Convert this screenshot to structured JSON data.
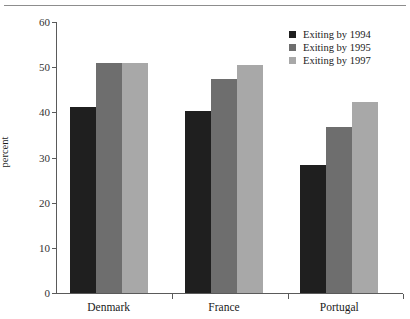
{
  "chart_data": {
    "type": "bar",
    "title": "",
    "xlabel": "",
    "ylabel": "percent",
    "categories": [
      "Denmark",
      "France",
      "Portugal"
    ],
    "ylim": [
      0,
      60
    ],
    "yticks": [
      0,
      10,
      20,
      30,
      40,
      50,
      60
    ],
    "ytick_labels": [
      "0",
      "10",
      "20",
      "30",
      "40",
      "50",
      "60"
    ],
    "grid": false,
    "legend_position": "top-right",
    "series": [
      {
        "name": "Exiting by 1994",
        "color": "#1f1f1f",
        "values": [
          41.2,
          40.4,
          28.3
        ]
      },
      {
        "name": "Exiting by 1995",
        "color": "#6e6e6e",
        "values": [
          50.9,
          47.3,
          36.7
        ]
      },
      {
        "name": "Exiting by 1997",
        "color": "#a8a8a8",
        "values": [
          50.9,
          50.5,
          42.2
        ]
      }
    ]
  },
  "legend": {
    "items": [
      {
        "label": "Exiting by 1994",
        "color": "#1f1f1f"
      },
      {
        "label": "Exiting by 1995",
        "color": "#6e6e6e"
      },
      {
        "label": "Exiting by 1997",
        "color": "#a8a8a8"
      }
    ]
  }
}
